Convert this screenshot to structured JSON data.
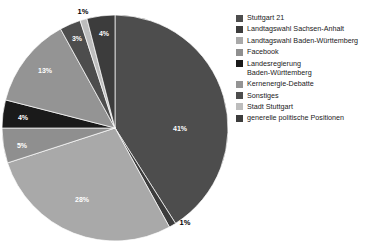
{
  "chart_data": {
    "type": "pie",
    "title": "",
    "subtitle": "",
    "xlabel": "",
    "ylabel": "",
    "legend_position": "right",
    "grid": false,
    "units": "percent",
    "start_angle_deg": 0,
    "direction": "clockwise",
    "categories": [
      "Stuttgart 21",
      "Landtagswahl Sachsen-Anhalt",
      "Landtagswahl Baden-Württemberg",
      "Facebook",
      "Landesregierung Baden-Württemberg",
      "Kernenergie-Debatte",
      "Sonstiges",
      "Stadt Stuttgart",
      "generelle politische Positionen"
    ],
    "values": [
      41,
      1,
      28,
      5,
      4,
      13,
      3,
      1,
      4
    ],
    "labels": [
      "41%",
      "1%",
      "28%",
      "5%",
      "4%",
      "13%",
      "3%",
      "1%",
      "4%"
    ],
    "colors": [
      "#4d4d4d",
      "#3c3c3c",
      "#a9a9a9",
      "#8f8f8f",
      "#1a1a1a",
      "#949494",
      "#4d4d4d",
      "#bdbdbd",
      "#3c3c3c"
    ],
    "slices": [
      {
        "label": "Stuttgart 21",
        "value": 41,
        "display": "41%",
        "color": "#4d4d4d",
        "label_inside": true,
        "label_x": 180,
        "label_y": 128
      },
      {
        "label": "Landtagswahl Sachsen-Anhalt",
        "value": 1,
        "display": "1%",
        "color": "#3c3c3c",
        "label_inside": false,
        "label_x": 185,
        "label_y": 223
      },
      {
        "label": "Landtagswahl Baden-Württemberg",
        "value": 28,
        "display": "28%",
        "color": "#a9a9a9",
        "label_inside": true,
        "label_x": 82,
        "label_y": 199
      },
      {
        "label": "Facebook",
        "value": 5,
        "display": "5%",
        "color": "#8f8f8f",
        "label_inside": true,
        "label_x": 22,
        "label_y": 145
      },
      {
        "label": "Landesregierung Baden-Württemberg",
        "value": 4,
        "display": "4%",
        "color": "#1a1a1a",
        "label_inside": true,
        "label_x": 23,
        "label_y": 117
      },
      {
        "label": "Kernenergie-Debatte",
        "value": 13,
        "display": "13%",
        "color": "#949494",
        "label_inside": true,
        "label_x": 45,
        "label_y": 70
      },
      {
        "label": "Sonstiges",
        "value": 3,
        "display": "3%",
        "color": "#4d4d4d",
        "label_inside": true,
        "label_x": 77,
        "label_y": 38
      },
      {
        "label": "Stadt Stuttgart",
        "value": 1,
        "display": "1%",
        "color": "#bdbdbd",
        "label_inside": false,
        "label_x": 83,
        "label_y": 12
      },
      {
        "label": "generelle politische Positionen",
        "value": 4,
        "display": "4%",
        "color": "#3c3c3c",
        "label_inside": true,
        "label_x": 104,
        "label_y": 33
      }
    ],
    "geometry": {
      "cx": 115,
      "cy": 128,
      "r": 113
    }
  },
  "legend": {
    "items": [
      {
        "label": "Stuttgart 21",
        "color": "#4d4d4d"
      },
      {
        "label": "Landtagswahl Sachsen-Anhalt",
        "color": "#3c3c3c"
      },
      {
        "label": "Landtagswahl Baden-Württemberg",
        "color": "#a9a9a9"
      },
      {
        "label": "Facebook",
        "color": "#8f8f8f"
      },
      {
        "label": "Landesregierung\nBaden-Württemberg",
        "color": "#1a1a1a"
      },
      {
        "label": "Kernenergie-Debatte",
        "color": "#949494"
      },
      {
        "label": "Sonstiges",
        "color": "#4d4d4d"
      },
      {
        "label": "Stadt Stuttgart",
        "color": "#bdbdbd"
      },
      {
        "label": "generelle politische Positionen",
        "color": "#3c3c3c"
      }
    ]
  }
}
